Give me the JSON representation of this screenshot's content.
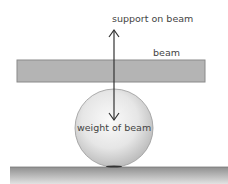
{
  "diagram": {
    "labels": {
      "support": "support on beam",
      "beam": "beam",
      "weight": "weight of beam"
    },
    "colors": {
      "beam_fill": "#b4b4b4",
      "beam_stroke": "#8a8a8a",
      "arrow": "#333333",
      "text": "#444444"
    }
  }
}
